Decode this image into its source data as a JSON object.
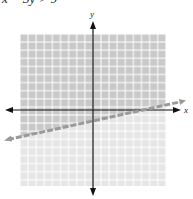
{
  "caption": "x − 3y > 9",
  "graph": {
    "x_axis_label": "x",
    "y_axis_label": "y",
    "boundary_line": {
      "style": "dashed",
      "color": "#9a9a9a"
    },
    "shaded_region_color": "#c9c9c9",
    "unshaded_region_color": "#e6e6e6",
    "grid_line_color": "#ffffff",
    "axis_color": "#111111"
  }
}
